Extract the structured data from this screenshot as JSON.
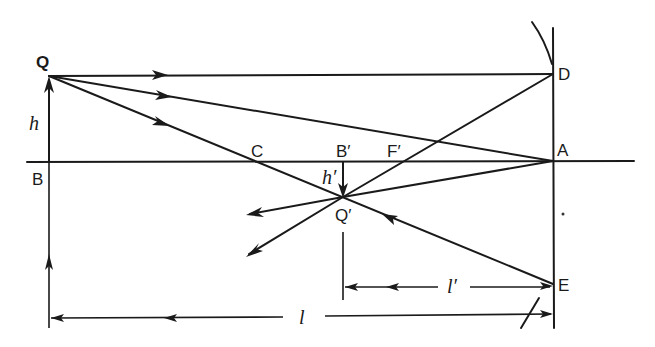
{
  "figure": {
    "labels": {
      "Q": "Q",
      "B": "B",
      "h": "h",
      "C": "C",
      "B_prime": "B′",
      "F_prime": "F′",
      "h_prime": "h′",
      "Q_prime": "Q′",
      "D": "D",
      "A": "A",
      "E": "E",
      "l": "l",
      "l_prime": "l′"
    },
    "points": {
      "Q": [
        49,
        76
      ],
      "B": [
        49,
        162
      ],
      "C": [
        262,
        162
      ],
      "B_prime": [
        343,
        162
      ],
      "F_prime": [
        402,
        162
      ],
      "Q_prime": [
        343,
        197
      ],
      "D": [
        553,
        74
      ],
      "A": [
        553,
        161
      ],
      "E": [
        553,
        284
      ]
    },
    "rays": [
      {
        "name": "parallel-ray",
        "from": "Q",
        "to": "D",
        "then": "F_prime→Q_prime"
      },
      {
        "name": "vertex-ray",
        "from": "Q",
        "to": "A",
        "then": "Q_prime"
      },
      {
        "name": "center-ray",
        "from": "Q",
        "through": "C",
        "to": "E",
        "then": "Q_prime"
      }
    ],
    "dimensions": {
      "object_distance": "l",
      "image_distance": "l′",
      "object_height": "h",
      "image_height": "h′"
    },
    "colors": {
      "ink": "#1a1a1a",
      "background": "#ffffff"
    }
  }
}
